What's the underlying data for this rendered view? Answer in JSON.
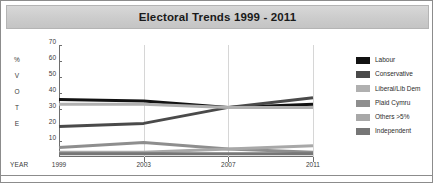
{
  "chart": {
    "title": "Electoral Trends 1999 - 2011",
    "year_axis_label": "YEAR",
    "vertical_axis_letters": [
      "%",
      "V",
      "O",
      "T",
      "E"
    ]
  },
  "chart_data": {
    "type": "line",
    "title": "Electoral Trends 1999 - 2011",
    "xlabel": "YEAR",
    "ylabel": "% VOTE",
    "x": [
      1999,
      2003,
      2007,
      2011
    ],
    "categories": [
      "1999",
      "2003",
      "2007",
      "2011"
    ],
    "xlim": [
      1999,
      2011
    ],
    "ylim": [
      0,
      70
    ],
    "yticks": [
      10,
      20,
      30,
      40,
      50,
      60,
      70
    ],
    "grid": "vertical-only",
    "legend_position": "right",
    "series": [
      {
        "name": "Labour",
        "color": "#121212",
        "values": [
          36,
          35,
          31,
          33
        ]
      },
      {
        "name": "Conservative",
        "color": "#4a4a4a",
        "values": [
          19,
          21,
          31,
          37
        ]
      },
      {
        "name": "Liberal/Lib Dem",
        "color": "#b0b0b0",
        "values": [
          33,
          33,
          31,
          31
        ]
      },
      {
        "name": "Plaid Cymru",
        "color": "#8e8e8e",
        "values": [
          6,
          9,
          5,
          3
        ]
      },
      {
        "name": "Others >5%",
        "color": "#a8a8a8",
        "values": [
          3,
          3,
          5,
          7
        ]
      },
      {
        "name": "Independent",
        "color": "#767676",
        "values": [
          2,
          2,
          2,
          2
        ]
      }
    ]
  },
  "legend": {
    "items": [
      {
        "label": "Labour",
        "color": "#121212"
      },
      {
        "label": "Conservative",
        "color": "#4a4a4a"
      },
      {
        "label": "Liberal/Lib Dem",
        "color": "#b0b0b0"
      },
      {
        "label": "Plaid Cymru",
        "color": "#8e8e8e"
      },
      {
        "label": "Others >5%",
        "color": "#a8a8a8"
      },
      {
        "label": "Independent",
        "color": "#767676"
      }
    ]
  }
}
